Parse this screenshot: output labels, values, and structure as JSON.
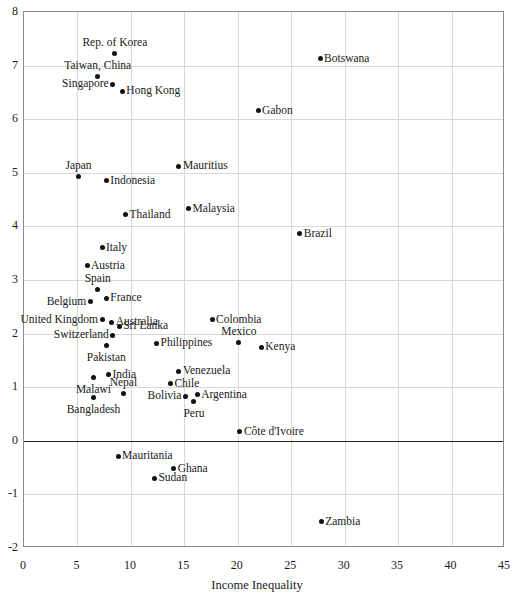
{
  "chart_data": {
    "type": "scatter",
    "title": "",
    "subtitle": "",
    "xlabel": "Income Inequality",
    "ylabel": "",
    "xlim": [
      0,
      45
    ],
    "ylim": [
      -2,
      8
    ],
    "xticks": [
      0,
      5,
      10,
      15,
      20,
      25,
      30,
      35,
      40,
      45
    ],
    "yticks": [
      8,
      7,
      6,
      5,
      4,
      3,
      2,
      1,
      0,
      -1,
      -2
    ],
    "grid": true,
    "legend": "none",
    "zero_reference_line": 0,
    "marker": "filled-circle",
    "marker_color": "#111111",
    "points": [
      {
        "label": "Rep. of Korea",
        "x": 8.5,
        "y": 7.22,
        "label_pos": "above"
      },
      {
        "label": "Botswana",
        "x": 27.7,
        "y": 7.13,
        "label_pos": "right"
      },
      {
        "label": "Taiwan, China",
        "x": 6.9,
        "y": 6.79,
        "label_pos": "above"
      },
      {
        "label": "Singapore",
        "x": 8.3,
        "y": 6.65,
        "label_pos": "left"
      },
      {
        "label": "Hong Kong",
        "x": 9.2,
        "y": 6.52,
        "label_pos": "right"
      },
      {
        "label": "Gabon",
        "x": 21.9,
        "y": 6.16,
        "label_pos": "right"
      },
      {
        "label": "Mauritius",
        "x": 14.5,
        "y": 5.12,
        "label_pos": "right"
      },
      {
        "label": "Japan",
        "x": 5.1,
        "y": 4.93,
        "label_pos": "above"
      },
      {
        "label": "Indonesia",
        "x": 7.7,
        "y": 4.85,
        "label_pos": "right"
      },
      {
        "label": "Malaysia",
        "x": 15.4,
        "y": 4.33,
        "label_pos": "right"
      },
      {
        "label": "Thailand",
        "x": 9.5,
        "y": 4.22,
        "label_pos": "right"
      },
      {
        "label": "Brazil",
        "x": 25.8,
        "y": 3.86,
        "label_pos": "right"
      },
      {
        "label": "Italy",
        "x": 7.3,
        "y": 3.6,
        "label_pos": "right"
      },
      {
        "label": "Austria",
        "x": 5.9,
        "y": 3.27,
        "label_pos": "right"
      },
      {
        "label": "Spain",
        "x": 6.9,
        "y": 2.82,
        "label_pos": "above"
      },
      {
        "label": "France",
        "x": 7.7,
        "y": 2.66,
        "label_pos": "right"
      },
      {
        "label": "Belgium",
        "x": 6.2,
        "y": 2.59,
        "label_pos": "left"
      },
      {
        "label": "Colombia",
        "x": 17.6,
        "y": 2.26,
        "label_pos": "right"
      },
      {
        "label": "United Kingdom",
        "x": 7.3,
        "y": 2.26,
        "label_pos": "left"
      },
      {
        "label": "Australia",
        "x": 8.2,
        "y": 2.21,
        "label_pos": "right"
      },
      {
        "label": "Sri Lanka",
        "x": 8.9,
        "y": 2.14,
        "label_pos": "right"
      },
      {
        "label": "Switzerland",
        "x": 8.3,
        "y": 1.97,
        "label_pos": "left"
      },
      {
        "label": "Mexico",
        "x": 20.1,
        "y": 1.83,
        "label_pos": "above"
      },
      {
        "label": "Philippines",
        "x": 12.4,
        "y": 1.82,
        "label_pos": "right"
      },
      {
        "label": "Pakistan",
        "x": 7.7,
        "y": 1.77,
        "label_pos": "below"
      },
      {
        "label": "Kenya",
        "x": 22.2,
        "y": 1.75,
        "label_pos": "right"
      },
      {
        "label": "Venezuela",
        "x": 14.5,
        "y": 1.3,
        "label_pos": "right"
      },
      {
        "label": "India",
        "x": 7.9,
        "y": 1.23,
        "label_pos": "right"
      },
      {
        "label": "Malawi",
        "x": 6.5,
        "y": 1.18,
        "label_pos": "below"
      },
      {
        "label": "Chile",
        "x": 13.7,
        "y": 1.06,
        "label_pos": "right"
      },
      {
        "label": "Nepal",
        "x": 9.3,
        "y": 0.88,
        "label_pos": "above"
      },
      {
        "label": "Argentina",
        "x": 16.2,
        "y": 0.86,
        "label_pos": "right"
      },
      {
        "label": "Bolivia",
        "x": 15.1,
        "y": 0.83,
        "label_pos": "left"
      },
      {
        "label": "Bangladesh",
        "x": 6.5,
        "y": 0.8,
        "label_pos": "below"
      },
      {
        "label": "Peru",
        "x": 15.9,
        "y": 0.73,
        "label_pos": "below"
      },
      {
        "label": "Côte d'Ivoire",
        "x": 20.2,
        "y": 0.17,
        "label_pos": "right"
      },
      {
        "label": "Mauritania",
        "x": 8.8,
        "y": -0.29,
        "label_pos": "right"
      },
      {
        "label": "Ghana",
        "x": 14.0,
        "y": -0.52,
        "label_pos": "right"
      },
      {
        "label": "Sudan",
        "x": 12.2,
        "y": -0.7,
        "label_pos": "right"
      },
      {
        "label": "Zambia",
        "x": 27.8,
        "y": -1.51,
        "label_pos": "right"
      }
    ]
  }
}
